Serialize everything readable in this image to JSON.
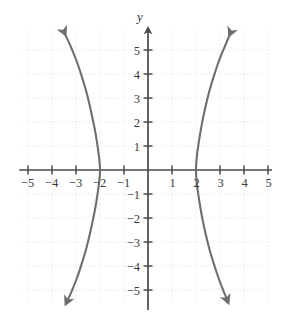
{
  "figure": {
    "bullet_marker": "•",
    "axis_labels": {
      "y": "y",
      "x": ""
    },
    "colors": {
      "curve": "#6e6e6e",
      "axis": "#4a4a4a",
      "grid": "#d9d9d9",
      "text": "#3a3a3a",
      "background": "#ffffff"
    }
  },
  "chart_data": {
    "type": "line",
    "title": "",
    "subtitle": "",
    "xlabel": "",
    "ylabel": "y",
    "xlim": [
      -5.2,
      5.0
    ],
    "ylim": [
      -5.8,
      5.8
    ],
    "grid": true,
    "grid_step": 1,
    "legend": "none",
    "equation": "x^2/4 - y^2/b^2 = 1",
    "x_ticks": [
      -5,
      -4,
      -3,
      -2,
      -1,
      1,
      2,
      3,
      4,
      5
    ],
    "x_tick_labels": [
      "-5",
      "-4",
      "-3",
      "-2",
      "-1",
      "1",
      "2",
      "3",
      "4",
      "5"
    ],
    "y_ticks": [
      -5,
      -4,
      -3,
      -2,
      -1,
      1,
      2,
      3,
      4,
      5
    ],
    "y_tick_labels": [
      "-5",
      "-4",
      "-3",
      "-2",
      "-1",
      "1",
      "2",
      "3",
      "4",
      "5"
    ],
    "vertices": [
      [
        -2,
        0
      ],
      [
        2,
        0
      ]
    ],
    "series": [
      {
        "name": "left-branch",
        "arrow_start": true,
        "arrow_end": true,
        "points": [
          [
            -3.45,
            5.65
          ],
          [
            -3.2,
            5.1
          ],
          [
            -2.96,
            4.5
          ],
          [
            -2.76,
            3.9
          ],
          [
            -2.58,
            3.3
          ],
          [
            -2.43,
            2.7
          ],
          [
            -2.3,
            2.1
          ],
          [
            -2.19,
            1.55
          ],
          [
            -2.11,
            1.05
          ],
          [
            -2.05,
            0.62
          ],
          [
            -2.01,
            0.25
          ],
          [
            -2.0,
            0.0
          ],
          [
            -2.01,
            -0.25
          ],
          [
            -2.05,
            -0.62
          ],
          [
            -2.11,
            -1.05
          ],
          [
            -2.19,
            -1.55
          ],
          [
            -2.3,
            -2.1
          ],
          [
            -2.43,
            -2.7
          ],
          [
            -2.58,
            -3.3
          ],
          [
            -2.76,
            -3.9
          ],
          [
            -2.96,
            -4.5
          ],
          [
            -3.2,
            -5.1
          ],
          [
            -3.42,
            -5.58
          ]
        ]
      },
      {
        "name": "right-branch",
        "arrow_start": true,
        "arrow_end": true,
        "points": [
          [
            3.4,
            5.62
          ],
          [
            3.18,
            5.1
          ],
          [
            2.94,
            4.5
          ],
          [
            2.74,
            3.9
          ],
          [
            2.56,
            3.3
          ],
          [
            2.41,
            2.7
          ],
          [
            2.28,
            2.1
          ],
          [
            2.18,
            1.55
          ],
          [
            2.1,
            1.05
          ],
          [
            2.04,
            0.62
          ],
          [
            2.01,
            0.25
          ],
          [
            2.0,
            0.0
          ],
          [
            2.01,
            -0.25
          ],
          [
            2.04,
            -0.62
          ],
          [
            2.1,
            -1.05
          ],
          [
            2.18,
            -1.55
          ],
          [
            2.28,
            -2.1
          ],
          [
            2.41,
            -2.7
          ],
          [
            2.56,
            -3.3
          ],
          [
            2.74,
            -3.9
          ],
          [
            2.94,
            -4.5
          ],
          [
            3.16,
            -5.08
          ],
          [
            3.34,
            -5.52
          ]
        ]
      }
    ]
  }
}
